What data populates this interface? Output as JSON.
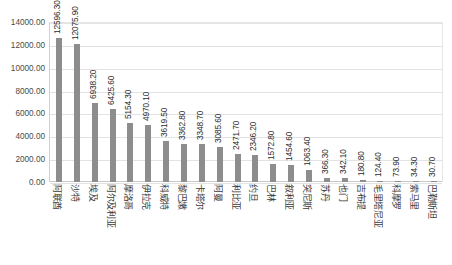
{
  "header": {
    "note": ""
  },
  "chart_data": {
    "type": "bar",
    "title": "",
    "subtitle": "",
    "xlabel": "",
    "ylabel": "",
    "ylim": [
      0,
      14000
    ],
    "ytick_step": 2000,
    "grid": true,
    "legend": false,
    "bar_color": "#8d8d8d",
    "data_label_format": "0.00",
    "ytick_labels": [
      "14000.00",
      "12000.00",
      "10000.00",
      "8000.00",
      "6000.00",
      "4000.00",
      "2000.00",
      "0.00"
    ],
    "ytick_values": [
      14000,
      12000,
      10000,
      8000,
      6000,
      4000,
      2000,
      0
    ],
    "categories": [
      "阿联酋",
      "沙特",
      "埃及",
      "阿尔及利亚",
      "摩洛哥",
      "伊拉克",
      "科威特",
      "黎巴嫩",
      "卡塔尔",
      "阿曼",
      "利比亚",
      "约旦",
      "巴林",
      "叙利亚",
      "突尼斯",
      "苏丹",
      "也门",
      "吉布提",
      "毛里塔尼亚",
      "科摩罗",
      "索马里",
      "巴勒斯坦"
    ],
    "values": [
      12596.3,
      12075.9,
      6938.2,
      6425.6,
      5154.3,
      4970.1,
      3619.5,
      3362.8,
      3348.7,
      3085.6,
      2471.7,
      2346.2,
      1572.8,
      1454.6,
      1063.4,
      366.3,
      342.1,
      180.8,
      124.4,
      73.9,
      34.3,
      30.7
    ],
    "value_labels": [
      "12596.30",
      "12075.90",
      "6938.20",
      "6425.60",
      "5154.30",
      "4970.10",
      "3619.50",
      "3362.80",
      "3348.70",
      "3085.60",
      "2471.70",
      "2346.20",
      "1572.80",
      "1454.60",
      "1063.40",
      "366.30",
      "342.10",
      "180.80",
      "124.40",
      "73.90",
      "34.30",
      "30.70"
    ]
  }
}
